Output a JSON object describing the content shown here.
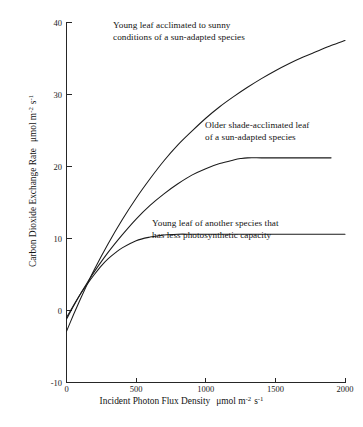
{
  "chart_data": {
    "type": "line",
    "title": "",
    "xlabel": "Incident Photon Flux Density  μmol m⁻² s⁻¹",
    "ylabel": "Carbon Dioxide Exchange Rate  μmol m⁻² s⁻¹",
    "xlim": [
      0,
      2000
    ],
    "ylim": [
      -10,
      40
    ],
    "xticks": [
      0,
      500,
      1000,
      1500,
      2000
    ],
    "yticks": [
      40,
      30,
      20,
      10,
      0,
      -10
    ],
    "xtick_labels": [
      "0",
      "500",
      "1000",
      "1500",
      "2000"
    ],
    "ytick_labels": [
      "40",
      "30",
      "20",
      "10",
      "0",
      "-10"
    ],
    "grid": false,
    "legend_position": "inline-annotations",
    "line_color": "#1b1b1b",
    "background_color": "#ffffff",
    "series": [
      {
        "name": "Young leaf acclimated to sunny conditions of a sun-adapted species",
        "dark_respiration": -2.9,
        "light_saturation_value": 37.5,
        "x": [
          0,
          50,
          100,
          150,
          200,
          300,
          400,
          500,
          600,
          700,
          800,
          900,
          1000,
          1100,
          1200,
          1300,
          1400,
          1500,
          1600,
          1700,
          1800,
          1900,
          2000
        ],
        "y": [
          -2.9,
          -0.6,
          1.6,
          3.7,
          5.7,
          9.3,
          12.6,
          15.6,
          18.3,
          20.8,
          23.0,
          24.9,
          26.7,
          28.3,
          29.7,
          31.0,
          32.2,
          33.3,
          34.3,
          35.2,
          36.0,
          36.8,
          37.5
        ]
      },
      {
        "name": "Older shade-acclimated leaf of a sun-adapted species",
        "dark_respiration": -1.2,
        "light_saturation_value": 21.2,
        "x": [
          0,
          50,
          100,
          150,
          200,
          300,
          400,
          500,
          600,
          700,
          800,
          900,
          1000,
          1100,
          1200,
          1250,
          1300,
          1400,
          1500,
          1600,
          1700,
          1800,
          1900
        ],
        "y": [
          -1.2,
          0.6,
          2.3,
          3.9,
          5.4,
          8.1,
          10.5,
          12.7,
          14.6,
          16.2,
          17.6,
          18.8,
          19.7,
          20.4,
          20.9,
          21.1,
          21.2,
          21.2,
          21.2,
          21.2,
          21.2,
          21.2,
          21.2
        ]
      },
      {
        "name": "Young leaf of another species that has less photosynthetic capacity",
        "dark_respiration": -1.0,
        "light_saturation_value": 10.6,
        "x": [
          0,
          50,
          100,
          150,
          200,
          250,
          300,
          350,
          400,
          500,
          600,
          700,
          800,
          900,
          1000,
          1200,
          1400,
          1600,
          1800,
          2000
        ],
        "y": [
          -1.0,
          0.7,
          2.3,
          3.7,
          5.0,
          6.2,
          7.2,
          8.0,
          8.7,
          9.7,
          10.2,
          10.5,
          10.6,
          10.6,
          10.6,
          10.6,
          10.6,
          10.6,
          10.6,
          10.6
        ]
      }
    ],
    "annotations": [
      {
        "id": "sun-adapted-young-leaf",
        "line1": "Young leaf acclimated to sunny",
        "line2": "conditions of a sun-adapted species"
      },
      {
        "id": "shade-acclimated-older-leaf",
        "line1": "Older shade-acclimated leaf",
        "line2": "of a sun-adapted species"
      },
      {
        "id": "low-capacity-young-leaf",
        "line1": "Young leaf of another species that",
        "line2": "has less photosynthetic capacity"
      }
    ],
    "axis_label_parts": {
      "x_main": "Incident Photon Flux Density",
      "x_unit_mu": "μmol m",
      "x_unit_sup1": "-2",
      "x_unit_s": "s",
      "x_unit_sup2": "-1",
      "y_main": "Carbon Dioxide Exchange Rate",
      "y_unit_mu": "μmol m",
      "y_unit_sup1": "-2",
      "y_unit_s": "s",
      "y_unit_sup2": "-1"
    }
  }
}
